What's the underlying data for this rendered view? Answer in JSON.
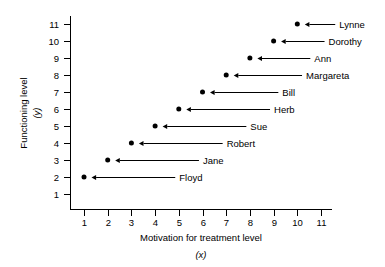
{
  "chart_data": {
    "type": "scatter",
    "title": "",
    "xlabel": "Motivation for treatment level",
    "xlabel_var": "(x)",
    "ylabel": "Functioning level",
    "ylabel_var": "(y)",
    "xlim": [
      0,
      11.8
    ],
    "ylim": [
      0,
      11.8
    ],
    "xticks": [
      "1",
      "2",
      "3",
      "4",
      "5",
      "6",
      "7",
      "8",
      "9",
      "10",
      "11"
    ],
    "yticks": [
      "1",
      "2",
      "3",
      "4",
      "5",
      "6",
      "7",
      "8",
      "9",
      "10",
      "11"
    ],
    "grid": false,
    "legend": "none",
    "marker_color": "#000000",
    "axis_color": "#000000",
    "points": [
      {
        "label": "Floyd",
        "x": 1,
        "y": 2
      },
      {
        "label": "Jane",
        "x": 2,
        "y": 3
      },
      {
        "label": "Robert",
        "x": 3,
        "y": 4
      },
      {
        "label": "Sue",
        "x": 4,
        "y": 5
      },
      {
        "label": "Herb",
        "x": 5,
        "y": 6
      },
      {
        "label": "Bill",
        "x": 6,
        "y": 7
      },
      {
        "label": "Margareta",
        "x": 7,
        "y": 8
      },
      {
        "label": "Ann",
        "x": 8,
        "y": 9
      },
      {
        "label": "Dorothy",
        "x": 9,
        "y": 10
      },
      {
        "label": "Lynne",
        "x": 10,
        "y": 11
      }
    ],
    "annotations": [
      {
        "label": "Floyd",
        "leader_end_x": 4.85,
        "arrow_points_to": "left"
      },
      {
        "label": "Jane",
        "leader_end_x": 5.85,
        "arrow_points_to": "left"
      },
      {
        "label": "Robert",
        "leader_end_x": 6.85,
        "arrow_points_to": "left"
      },
      {
        "label": "Sue",
        "leader_end_x": 7.85,
        "arrow_points_to": "left"
      },
      {
        "label": "Herb",
        "leader_end_x": 8.85,
        "arrow_points_to": "left"
      },
      {
        "label": "Bill",
        "leader_end_x": 9.2,
        "arrow_points_to": "left"
      },
      {
        "label": "Margareta",
        "leader_end_x": 10.2,
        "arrow_points_to": "left"
      },
      {
        "label": "Ann",
        "leader_end_x": 10.55,
        "arrow_points_to": "left"
      },
      {
        "label": "Dorothy",
        "leader_end_x": 11.15,
        "arrow_points_to": "left"
      },
      {
        "label": "Lynne",
        "leader_end_x": 11.6,
        "arrow_points_to": "left"
      }
    ]
  }
}
